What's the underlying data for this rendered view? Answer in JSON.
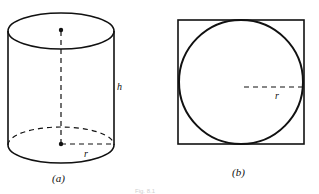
{
  "figure": {
    "panel_a": {
      "caption": "(a)",
      "shape": "cylinder",
      "labels": {
        "height": "h",
        "radius": "r"
      }
    },
    "panel_b": {
      "caption": "(b)",
      "shape": "circle inscribed in square",
      "labels": {
        "radius": "r"
      }
    },
    "bottom_caption_partial": "Fig. 8.1"
  },
  "colors": {
    "stroke": "#111111",
    "background": "#ffffff"
  }
}
